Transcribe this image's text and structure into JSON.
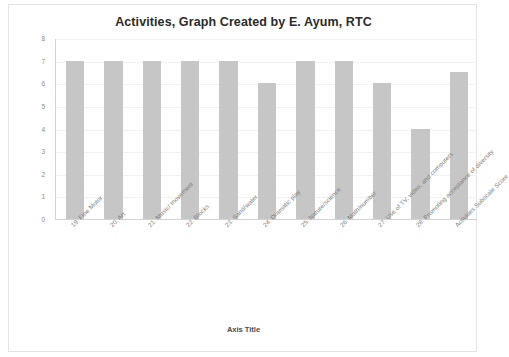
{
  "chart_data": {
    "type": "bar",
    "title": "Activities, Graph Created by E. Ayum, RTC",
    "xlabel": "Axis Title",
    "ylabel": "",
    "ylim": [
      0,
      8
    ],
    "ytick_step": 1,
    "yticks": [
      "8",
      "7",
      "6",
      "5",
      "4",
      "3",
      "2",
      "1",
      "0"
    ],
    "grid": true,
    "legend": false,
    "bar_color": "#c6c6c6",
    "plot_background": "#ffffff",
    "categories": [
      "19. Fine Motor",
      "20. Art",
      "21. Music/ movement",
      "22. Blocks",
      "23. Sand/water",
      "24. Dramatic play",
      "25. Nature/science",
      "26. Math/number",
      "27. Use of TV, video, and computers",
      "28. Promoting acceptance of diversity",
      "Activities Subscale Score"
    ],
    "values": [
      7,
      7,
      7,
      7,
      7,
      6,
      7,
      7,
      6,
      4,
      6.5
    ],
    "series": [
      {
        "name": "Activities",
        "values": [
          7,
          7,
          7,
          7,
          7,
          6,
          7,
          7,
          6,
          4,
          6.5
        ]
      }
    ]
  }
}
